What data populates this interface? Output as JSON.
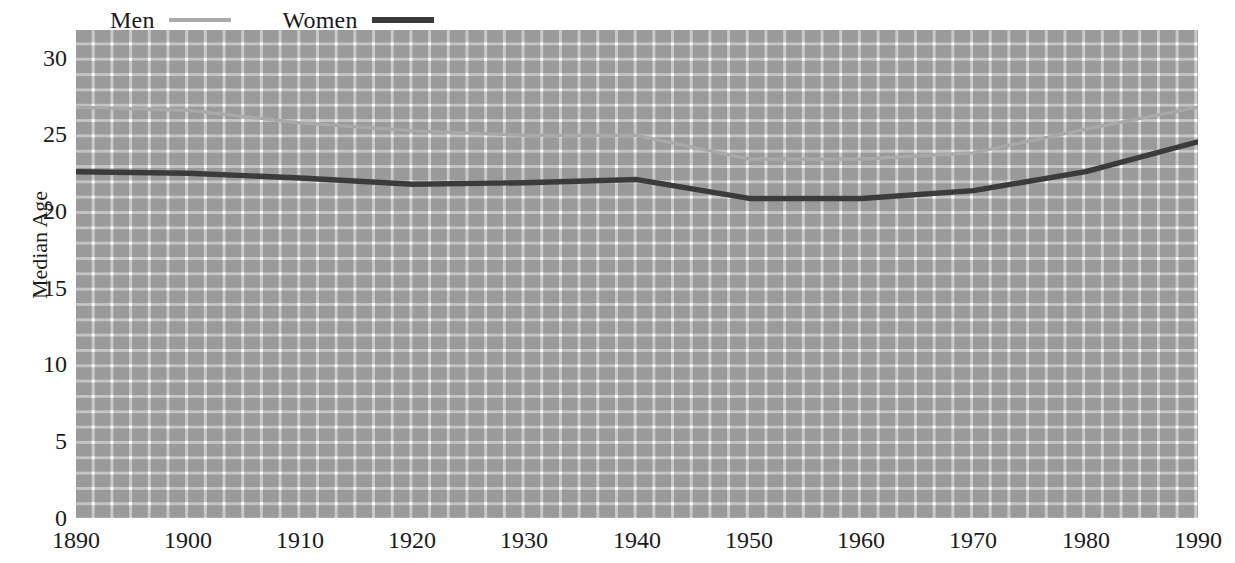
{
  "chart_data": {
    "type": "line",
    "title": "",
    "xlabel": "",
    "ylabel": "Median Age",
    "xlim": [
      1890,
      1990
    ],
    "ylim": [
      0,
      31
    ],
    "grid": true,
    "legend_position": "top-left",
    "y_ticks": [
      30,
      25,
      20,
      15,
      10,
      5,
      0
    ],
    "x_ticks": [
      1890,
      1900,
      1910,
      1920,
      1930,
      1940,
      1950,
      1960,
      1970,
      1980,
      1990
    ],
    "x": [
      1890,
      1900,
      1910,
      1920,
      1930,
      1940,
      1950,
      1960,
      1970,
      1980,
      1990
    ],
    "series": [
      {
        "name": "Men",
        "color": "#a9a9a9",
        "values": [
          26.1,
          25.9,
          25.1,
          24.6,
          24.3,
          24.3,
          22.8,
          22.8,
          23.2,
          24.7,
          26.1
        ]
      },
      {
        "name": "Women",
        "color": "#3b3b3b",
        "values": [
          22.0,
          21.9,
          21.6,
          21.2,
          21.3,
          21.5,
          20.3,
          20.3,
          20.8,
          22.0,
          23.9
        ]
      }
    ]
  },
  "legend": {
    "entries": [
      {
        "label": "Men",
        "swatch": "men-line-swatch"
      },
      {
        "label": "Women",
        "swatch": "women-line-swatch"
      }
    ]
  },
  "axes": {
    "y_label": "Median Age",
    "y_tick_labels": [
      "30",
      "25",
      "20",
      "15",
      "10",
      "5",
      "0"
    ],
    "x_tick_labels": [
      "1890",
      "1900",
      "1910",
      "1920",
      "1930",
      "1940",
      "1950",
      "1960",
      "1970",
      "1980",
      "1990"
    ]
  },
  "colors": {
    "men_line": "#a9a9a9",
    "women_line": "#3b3b3b",
    "grid_cell": "#c6c6c6",
    "background": "#ffffff",
    "text": "#1a1a1a"
  }
}
